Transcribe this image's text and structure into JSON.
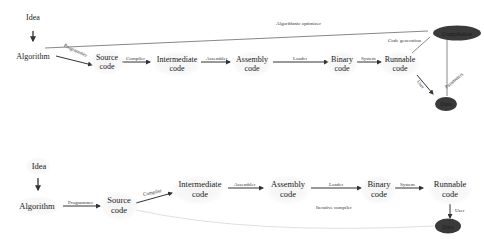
{
  "diagrams": [
    {
      "id": "top",
      "nodes": {
        "idea": "Idea",
        "algorithm": "Algorithm",
        "source_code": [
          "Source",
          "code"
        ],
        "intermediate_code": [
          "Intermediate",
          "code"
        ],
        "assembly_code": [
          "Assembly",
          "code"
        ],
        "binary_code": [
          "Binary",
          "code"
        ],
        "runnable_code": [
          "Runnable",
          "code"
        ],
        "compilation": "Compilation",
        "data": "Data"
      },
      "edges": {
        "programmer": "Programmer",
        "compiler": "Compiler",
        "assembler": "Assembler",
        "loader": "Loader",
        "system": "System",
        "algorithmic_optimizer": "Algorithmic optimizer",
        "code_generation": "Code generation",
        "user": "User",
        "parameters": "Parameters"
      }
    },
    {
      "id": "bottom",
      "nodes": {
        "idea": "Idea",
        "algorithm": "Algorithm",
        "source_code": [
          "Source",
          "code"
        ],
        "intermediate_code": [
          "Intermediate",
          "code"
        ],
        "assembly_code": [
          "Assembly",
          "code"
        ],
        "binary_code": [
          "Binary",
          "code"
        ],
        "runnable_code": [
          "Runnable",
          "code"
        ],
        "data": "Data"
      },
      "edges": {
        "programmer": "Programmer",
        "compiler": "Compiler",
        "assembler": "Assembler",
        "loader": "Loader",
        "system": "System",
        "iterative_compiler": "Iterative compiler",
        "user": "User"
      }
    }
  ]
}
